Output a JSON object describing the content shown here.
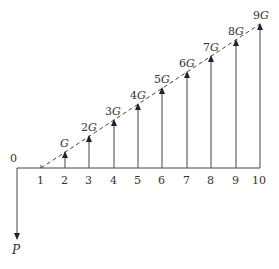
{
  "diagram": {
    "type": "cash-flow diagram (arithmetic gradient)",
    "axis": {
      "origin_label": "0",
      "tick_labels": [
        "1",
        "2",
        "3",
        "4",
        "5",
        "6",
        "7",
        "8",
        "9",
        "10"
      ]
    },
    "gradient_arrows": [
      {
        "period": 2,
        "coef": "",
        "symbol": "G"
      },
      {
        "period": 3,
        "coef": "2",
        "symbol": "G"
      },
      {
        "period": 4,
        "coef": "3",
        "symbol": "G"
      },
      {
        "period": 5,
        "coef": "4",
        "symbol": "G"
      },
      {
        "period": 6,
        "coef": "5",
        "symbol": "G"
      },
      {
        "period": 7,
        "coef": "6",
        "symbol": "G"
      },
      {
        "period": 8,
        "coef": "7",
        "symbol": "G"
      },
      {
        "period": 9,
        "coef": "8",
        "symbol": "G"
      },
      {
        "period": 10,
        "coef": "9",
        "symbol": "G"
      }
    ],
    "present_value_label": "P",
    "line_color": "#444444",
    "dashed_line": "gradient trend line from period 1 to period 10"
  }
}
